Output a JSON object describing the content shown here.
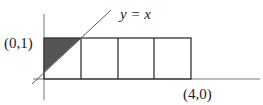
{
  "diagram": {
    "line_label": "y = x",
    "point_top_left": "(0,1)",
    "point_bottom_right": "(4,0)",
    "rectangle": {
      "columns": 4,
      "width_units": 4,
      "height_units": 1
    },
    "shaded_region": "triangle between y-axis, y=1 and y=x",
    "colors": {
      "stroke": "#333333",
      "shade": "#555555",
      "axis": "#666666"
    }
  }
}
